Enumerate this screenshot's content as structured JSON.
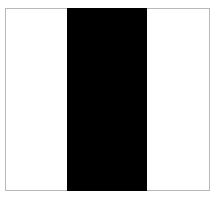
{
  "colors": {
    "background": "#ffffff",
    "frame_border": "#b8b8b8",
    "bar": "#000000"
  },
  "panels": [
    {
      "name": "left",
      "color": "#ffffff"
    },
    {
      "name": "center",
      "color": "#000000"
    },
    {
      "name": "right",
      "color": "#ffffff"
    }
  ]
}
